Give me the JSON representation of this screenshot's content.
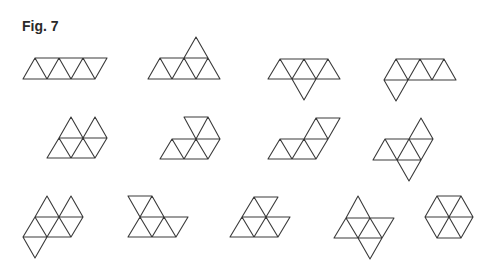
{
  "figure": {
    "label": "Fig. 7",
    "stroke_color": "#3a3a3a",
    "background": "#ffffff"
  },
  "shapes": [
    {
      "id": 1,
      "name": "bar",
      "d": "M23,79 L95,79 L107,58 L35,58 Z M23,79 L35,58 L47,79 L59,58 L71,79 L83,58 L95,79 L107,58"
    },
    {
      "id": 2,
      "name": "crown",
      "d": "M148,79 L220,79 L196,37 L184,58 L160,58 Z M160,58 L184,58 M148,79 L160,58 L172,79 L184,58 L196,79 L208,58 L220,79 M184,58 L208,58"
    },
    {
      "id": 3,
      "name": "sphinx-down-mid",
      "d": "M268,79 L340,79 L328,59 L280,59 Z M268,79 L280,59 L292,79 L304,59 L316,79 L328,59 M292,79 L304,100 L316,79"
    },
    {
      "id": 4,
      "name": "sphinx-down-left",
      "d": "M384,80 L456,80 L444,59 L396,59 Z M384,80 L396,59 L408,80 L420,59 L432,80 L444,59 M384,80 L396,101 L408,80"
    },
    {
      "id": 5,
      "name": "butterfly-up",
      "d": "M47,158 L95,158 L107,138 L95,117 L83,138 L71,117 L59,138 Z M59,138 L107,138 M47,158 L59,138 M71,158 L83,138 L95,158 M71,158 L59,138 M71,117 L83,138 L95,117 M95,158 L107,138"
    },
    {
      "id": 6,
      "name": "hook",
      "d": "M160,159 L208,159 L220,139 L208,117 L184,117 L196,139 L172,139 Z M172,139 L220,139 M160,159 L172,139 L184,159 L196,139 L208,159 M196,139 L208,117"
    },
    {
      "id": 7,
      "name": "snake",
      "d": "M268,159 L316,159 L328,139 L340,118 L316,118 L304,139 L280,139 Z M280,139 L328,139 M268,159 L280,139 L292,159 L304,139 L316,159 L328,139 M316,118 L328,139"
    },
    {
      "id": 8,
      "name": "yacht",
      "d": "M373,160 L421,160 L433,139 L421,118 L409,139 L385,139 Z M385,139 L433,139 M373,160 L385,139 L397,160 L409,139 L421,160 M409,139 L421,160 M397,160 L409,181 L421,160"
    },
    {
      "id": 9,
      "name": "signpost",
      "d": "M23,237 L35,217 L47,196 L59,217 L71,196 L83,217 L71,237 L47,237 L35,258 Z M35,217 L83,217 M23,237 L47,237 M35,217 L47,237 L59,217 L71,237 M47,237 L35,258"
    },
    {
      "id": 10,
      "name": "lobster",
      "d": "M128,237 L176,237 L188,217 L140,217 L128,196 L152,196 L140,217 M140,217 L128,237 M140,217 L152,237 L164,217 L176,237 M152,196 L164,217"
    },
    {
      "id": 11,
      "name": "hexagon-notch",
      "d": "M230,237 L278,237 L290,217 L242,217 M230,237 L242,217 L254,237 L266,217 L278,237 M242,217 L254,197 L278,197 L266,217 M254,197 L266,217"
    },
    {
      "id": 12,
      "name": "star",
      "d": "M334,238 L346,218 L358,196 L370,218 L394,218 L382,238 L370,259 L358,238 Z M346,218 L370,218 M334,238 L382,238 M346,218 L358,238 L370,218 L382,238 M358,238 L370,259"
    },
    {
      "id": 13,
      "name": "hexagon",
      "d": "M437,196 L461,196 L473,217 L461,238 L437,238 L425,217 Z M425,217 L473,217 M437,196 L461,238 M461,196 L437,238"
    }
  ]
}
